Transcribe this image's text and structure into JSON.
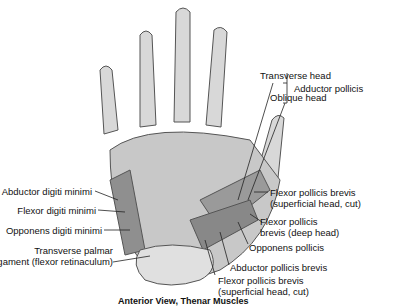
{
  "diagram": {
    "caption": "Anterior View, Thenar Muscles",
    "labels": {
      "transverse_head": "Transverse head",
      "oblique_head": "Oblique head",
      "adductor_pollicis": "Adductor pollicis",
      "fpb_superficial_1": "Flexor pollicis brevis",
      "fpb_superficial_2": "(superficial head, cut)",
      "fpb_deep_1": "Flexor pollicis",
      "fpb_deep_2": "brevis (deep head)",
      "opponens_pollicis": "Opponens pollicis",
      "abductor_pollicis_brevis": "Abductor pollicis brevis",
      "fpb_bottom_1": "Flexor pollicis brevis",
      "fpb_bottom_2": "(superficial head, cut)",
      "abductor_digiti_minimi": "Abductor digiti minimi",
      "flexor_digiti_minimi": "Flexor digiti minimi",
      "opponens_digiti_minimi": "Opponens digiti minimi",
      "transverse_palmar_1": "Transverse palmar",
      "transverse_palmar_2": "ligament (flexor retinaculum)"
    }
  }
}
